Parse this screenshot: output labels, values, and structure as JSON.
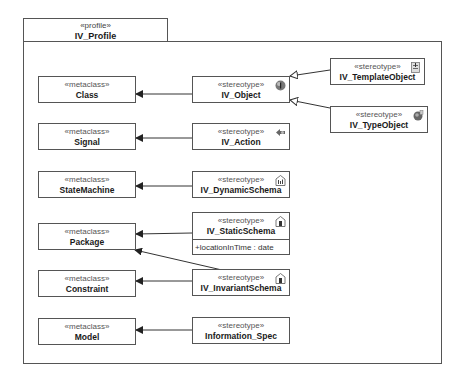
{
  "profile": {
    "stereotype": "«profile»",
    "name": "IV_Profile"
  },
  "metaclasses": [
    {
      "id": "class",
      "stereotype": "«metaclass»",
      "name": "Class"
    },
    {
      "id": "signal",
      "stereotype": "«metaclass»",
      "name": "Signal"
    },
    {
      "id": "statemachine",
      "stereotype": "«metaclass»",
      "name": "StateMachine"
    },
    {
      "id": "package",
      "stereotype": "«metaclass»",
      "name": "Package"
    },
    {
      "id": "constraint",
      "stereotype": "«metaclass»",
      "name": "Constraint"
    },
    {
      "id": "model",
      "stereotype": "«metaclass»",
      "name": "Model"
    }
  ],
  "stereotypes": [
    {
      "id": "iv_object",
      "stereotype": "«stereotype»",
      "name": "IV_Object",
      "icon": "object-icon"
    },
    {
      "id": "iv_templateobject",
      "stereotype": "«stereotype»",
      "name": "IV_TemplateObject",
      "icon": "template-object-icon"
    },
    {
      "id": "iv_typeobject",
      "stereotype": "«stereotype»",
      "name": "IV_TypeObject",
      "icon": "type-object-icon"
    },
    {
      "id": "iv_action",
      "stereotype": "«stereotype»",
      "name": "IV_Action",
      "icon": "action-icon"
    },
    {
      "id": "iv_dynamicschema",
      "stereotype": "«stereotype»",
      "name": "IV_DynamicSchema",
      "icon": "dynamic-schema-icon"
    },
    {
      "id": "iv_staticschema",
      "stereotype": "«stereotype»",
      "name": "IV_StaticSchema",
      "icon": "static-schema-icon",
      "attributes": [
        "+locationInTime : date"
      ]
    },
    {
      "id": "iv_invariantschema",
      "stereotype": "«stereotype»",
      "name": "IV_InvariantSchema",
      "icon": "invariant-schema-icon"
    },
    {
      "id": "information_spec",
      "stereotype": "«stereotype»",
      "name": "Information_Spec"
    }
  ],
  "relations": [
    {
      "type": "extension",
      "from": "IV_Object",
      "to": "Class"
    },
    {
      "type": "generalization",
      "from": "IV_TemplateObject",
      "to": "IV_Object"
    },
    {
      "type": "generalization",
      "from": "IV_TypeObject",
      "to": "IV_Object"
    },
    {
      "type": "extension",
      "from": "IV_Action",
      "to": "Signal"
    },
    {
      "type": "extension",
      "from": "IV_DynamicSchema",
      "to": "StateMachine"
    },
    {
      "type": "extension",
      "from": "IV_StaticSchema",
      "to": "Package"
    },
    {
      "type": "extension",
      "from": "IV_InvariantSchema",
      "to": "Package"
    },
    {
      "type": "extension",
      "from": "IV_InvariantSchema",
      "to": "Constraint"
    },
    {
      "type": "extension",
      "from": "Information_Spec",
      "to": "Model"
    }
  ]
}
